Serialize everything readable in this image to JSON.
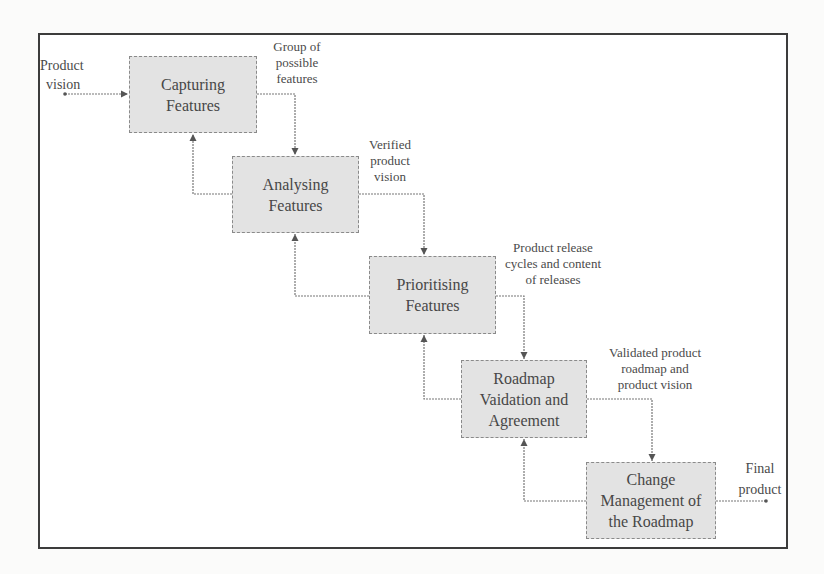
{
  "diagram": {
    "type": "process-flow",
    "nodes": [
      {
        "id": "capturing",
        "label": "Capturing Features",
        "lines": [
          "Capturing",
          "Features"
        ]
      },
      {
        "id": "analysing",
        "label": "Analysing Features",
        "lines": [
          "Analysing",
          "Features"
        ]
      },
      {
        "id": "prioritising",
        "label": "Prioritising Features",
        "lines": [
          "Prioritising",
          "Features"
        ]
      },
      {
        "id": "roadmap",
        "label": "Roadmap Vaidation and Agreement",
        "lines": [
          "Roadmap",
          "Vaidation and",
          "Agreement"
        ]
      },
      {
        "id": "change",
        "label": "Change Management of the Roadmap",
        "lines": [
          "Change",
          "Management of",
          "the Roadmap"
        ]
      }
    ],
    "edge_labels": {
      "input": [
        "Product",
        "vision"
      ],
      "capturing_to_analysing": [
        "Group of",
        "possible",
        "features"
      ],
      "analysing_to_prioritising": [
        "Verified",
        "product",
        "vision"
      ],
      "prioritising_to_roadmap": [
        "Product release",
        "cycles and content",
        "of releases"
      ],
      "roadmap_to_change": [
        "Validated product",
        "roadmap and",
        "product vision"
      ],
      "output": [
        "Final",
        "product"
      ]
    },
    "edges": [
      {
        "from": "input",
        "to": "capturing",
        "label": "Product vision"
      },
      {
        "from": "capturing",
        "to": "analysing",
        "label": "Group of possible features"
      },
      {
        "from": "analysing",
        "to": "prioritising",
        "label": "Verified product vision"
      },
      {
        "from": "prioritising",
        "to": "roadmap",
        "label": "Product release cycles and content of releases"
      },
      {
        "from": "roadmap",
        "to": "change",
        "label": "Validated product roadmap and product vision"
      },
      {
        "from": "change",
        "to": "output",
        "label": "Final product"
      },
      {
        "from": "analysing",
        "to": "capturing",
        "label": "feedback"
      },
      {
        "from": "prioritising",
        "to": "analysing",
        "label": "feedback"
      },
      {
        "from": "roadmap",
        "to": "prioritising",
        "label": "feedback"
      },
      {
        "from": "change",
        "to": "roadmap",
        "label": "feedback"
      }
    ]
  },
  "colors": {
    "box_fill": "#e3e3e3",
    "box_border": "#8a8a8a",
    "line": "#6f6f6f",
    "frame": "#3c3c3c"
  }
}
